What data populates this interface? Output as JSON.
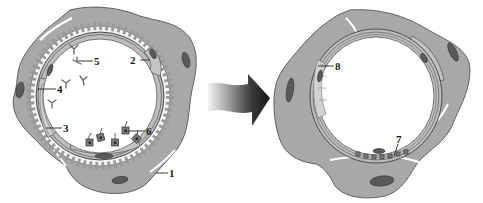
{
  "figure": {
    "colors": {
      "tissue": "#a9a9a9",
      "tissue_light": "#c9c9c9",
      "nucleus": "#5a5a5a",
      "outline": "#4a4a4a",
      "ring": "#8a8a8a",
      "arrow_dark": "#1e1e1e",
      "arrow_light": "#f2f2f2"
    },
    "left_panel": {
      "name": "before",
      "labels": [
        {
          "id": "1",
          "text": "1"
        },
        {
          "id": "2",
          "text": "2"
        },
        {
          "id": "3",
          "text": "3"
        },
        {
          "id": "4",
          "text": "4"
        },
        {
          "id": "5",
          "text": "5"
        },
        {
          "id": "6",
          "text": "6"
        }
      ]
    },
    "arrow": {
      "direction": "right",
      "style": "gradient light-to-dark"
    },
    "right_panel": {
      "name": "after",
      "labels": [
        {
          "id": "7",
          "text": "7"
        },
        {
          "id": "8",
          "text": "8"
        }
      ]
    }
  }
}
